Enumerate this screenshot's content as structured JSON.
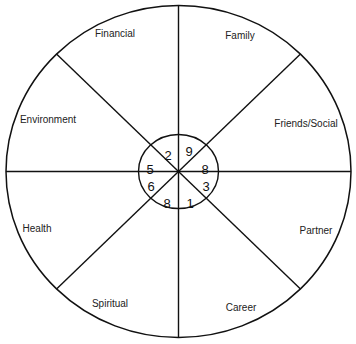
{
  "diagram": {
    "type": "wheel-of-life",
    "outer": {
      "cx": 178.5,
      "cy": 171.5,
      "rx": 172.5,
      "ry": 166
    },
    "inner": {
      "cx": 178.5,
      "cy": 171.5,
      "rx": 40,
      "ry": 37
    },
    "line_color": "#111111",
    "segments": [
      {
        "label": "Family",
        "score": "9",
        "lx": 240,
        "ly": 39,
        "nx": 189,
        "ny": 151
      },
      {
        "label": "Friends/Social",
        "score": "8",
        "lx": 306,
        "ly": 127,
        "nx": 205,
        "ny": 169
      },
      {
        "label": "Partner",
        "score": "3",
        "lx": 316,
        "ly": 234,
        "nx": 206,
        "ny": 186
      },
      {
        "label": "Career",
        "score": "1",
        "lx": 241,
        "ly": 311,
        "nx": 190,
        "ny": 203
      },
      {
        "label": "Spiritual",
        "score": "8",
        "lx": 110,
        "ly": 307,
        "nx": 167,
        "ny": 203
      },
      {
        "label": "Health",
        "score": "6",
        "lx": 37,
        "ly": 232,
        "nx": 151,
        "ny": 186
      },
      {
        "label": "Environment",
        "score": "5",
        "lx": 48,
        "ly": 123,
        "nx": 150,
        "ny": 169
      },
      {
        "label": "Financial",
        "score": "2",
        "lx": 115,
        "ly": 37,
        "nx": 168,
        "ny": 155
      }
    ]
  }
}
